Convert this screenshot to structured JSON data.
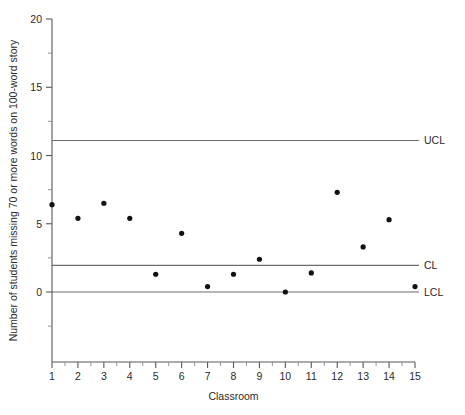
{
  "chart_data": {
    "type": "scatter",
    "title": "",
    "xlabel": "Classroom",
    "ylabel": "Number of students missing 70 or more words on 100-word story",
    "xlim": [
      1,
      15
    ],
    "ylim": [
      -5,
      20
    ],
    "y_axis_visible_range": [
      0,
      20
    ],
    "grid": false,
    "legend": "none",
    "x_ticks": [
      1,
      2,
      3,
      4,
      5,
      6,
      7,
      8,
      9,
      10,
      11,
      12,
      13,
      14,
      15
    ],
    "x_tick_labels": [
      "1",
      "2",
      "3",
      "4",
      "5",
      "6",
      "7",
      "8",
      "9",
      "10",
      "11",
      "12",
      "13",
      "14",
      "15"
    ],
    "x_minor_tick_step": 0.5,
    "y_ticks": [
      0,
      5,
      10,
      15,
      20
    ],
    "y_tick_labels": [
      "0",
      "5",
      "10",
      "15",
      "20"
    ],
    "y_minor_tick_step": 2.5,
    "categories": [
      "1",
      "2",
      "3",
      "4",
      "5",
      "6",
      "7",
      "8",
      "9",
      "10",
      "11",
      "12",
      "13",
      "14",
      "15"
    ],
    "x": [
      1,
      2,
      3,
      4,
      5,
      6,
      7,
      8,
      9,
      10,
      11,
      12,
      13,
      14,
      15
    ],
    "values": [
      6.4,
      5.4,
      6.5,
      5.4,
      1.3,
      4.3,
      0.4,
      1.3,
      2.4,
      0.0,
      1.4,
      7.3,
      3.3,
      5.3,
      0.4
    ],
    "series": [
      {
        "name": "Students missing 70 or more words",
        "values": [
          6.4,
          5.4,
          6.5,
          5.4,
          1.3,
          4.3,
          0.4,
          1.3,
          2.4,
          0.0,
          1.4,
          7.3,
          3.3,
          5.3,
          0.4
        ]
      }
    ],
    "control_limits": [
      {
        "key": "ucl",
        "label": "UCL",
        "value": 11.1
      },
      {
        "key": "cl",
        "label": "CL",
        "value": 1.95
      },
      {
        "key": "lcl",
        "label": "LCL",
        "value": 0.0
      }
    ],
    "colors": {
      "point": "#111111",
      "axis": "#58585a",
      "limit_line": "#6d6d70",
      "background": "#ffffff",
      "text": "#2a2a2a"
    }
  }
}
